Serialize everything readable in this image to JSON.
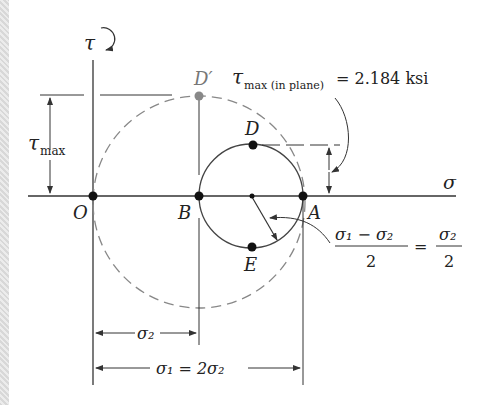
{
  "diagram": {
    "type": "mohr-circle",
    "axes": {
      "horizontal": "σ",
      "vertical": "τ"
    },
    "points": {
      "O": "O",
      "B": "B",
      "A": "A",
      "D": "D",
      "E": "E",
      "D_prime": "D′"
    },
    "labels": {
      "tau_max_left": "τ",
      "tau_max_left_sub": "max",
      "tau_max_inplane": "τ",
      "tau_max_inplane_sub": "max (in plane)",
      "tau_max_inplane_value": "= 2.184 ksi",
      "radius_numerator": "σ₁ − σ₂",
      "radius_denominator": "2",
      "radius_equals": "=",
      "radius_rhs_numerator": "σ₂",
      "radius_rhs_denominator": "2",
      "sigma2_dim": "σ₂",
      "sigma1_dim": "σ₁ = 2σ₂"
    },
    "colors": {
      "line": "#333333",
      "dashed_circle": "#888888",
      "point": "#111111",
      "point_Dprime": "#888888"
    }
  }
}
